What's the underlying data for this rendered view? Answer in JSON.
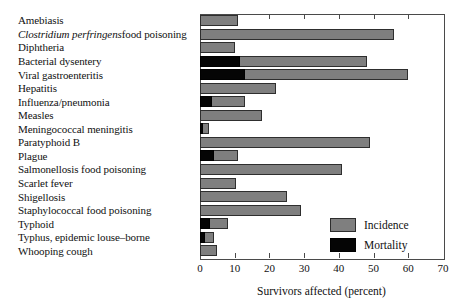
{
  "chart_data": {
    "type": "bar",
    "orientation": "horizontal",
    "title": "",
    "xlabel": "Survivors affected (percent)",
    "ylabel": "",
    "xlim": [
      0,
      70
    ],
    "xticks": [
      0,
      10,
      20,
      30,
      40,
      50,
      60,
      70
    ],
    "grid": false,
    "legend_position": "inside-lower-right",
    "categories": [
      "Amebiasis",
      "Clostridium perfringens food poisoning",
      "Diphtheria",
      "Bacterial dysentery",
      "Viral gastroenteritis",
      "Hepatitis",
      "Influenza/pneumonia",
      "Measles",
      "Meningococcal meningitis",
      "Paratyphoid B",
      "Plague",
      "Salmonellosis food poisoning",
      "Scarlet fever",
      "Shigellosis",
      "Staphylococcal food poisoning",
      "Typhoid",
      "Typhus, epidemic louse-borne",
      "Whooping cough"
    ],
    "category_label_parts": [
      {
        "italic": "",
        "plain": "Amebiasis"
      },
      {
        "italic": "Clostridium perfringens",
        "plain": " food poisoning"
      },
      {
        "italic": "",
        "plain": "Diphtheria"
      },
      {
        "italic": "",
        "plain": "Bacterial dysentery"
      },
      {
        "italic": "",
        "plain": "Viral gastroenteritis"
      },
      {
        "italic": "",
        "plain": "Hepatitis"
      },
      {
        "italic": "",
        "plain": "Influenza/pneumonia"
      },
      {
        "italic": "",
        "plain": "Measles"
      },
      {
        "italic": "",
        "plain": "Meningococcal meningitis"
      },
      {
        "italic": "",
        "plain": "Paratyphoid B"
      },
      {
        "italic": "",
        "plain": "Plague"
      },
      {
        "italic": "",
        "plain": "Salmonellosis food poisoning"
      },
      {
        "italic": "",
        "plain": "Scarlet fever"
      },
      {
        "italic": "",
        "plain": "Shigellosis"
      },
      {
        "italic": "",
        "plain": "Staphylococcal food poisoning"
      },
      {
        "italic": "",
        "plain": "Typhoid"
      },
      {
        "italic": "",
        "plain": "Typhus, epidemic louse–borne"
      },
      {
        "italic": "",
        "plain": "Whooping cough"
      }
    ],
    "series": [
      {
        "name": "Incidence",
        "color": "#7f7f7f",
        "values": [
          11,
          56,
          10,
          48,
          60,
          22,
          13,
          18,
          2.5,
          49,
          11,
          41,
          10.5,
          25,
          29,
          8,
          4,
          5
        ]
      },
      {
        "name": "Mortality",
        "color": "#050505",
        "values": [
          0,
          0,
          0,
          11.5,
          13,
          0,
          3.5,
          0,
          1,
          0,
          4,
          0,
          0,
          0,
          0,
          3,
          1.5,
          0
        ]
      }
    ]
  },
  "legend": {
    "items": [
      {
        "label": "Incidence",
        "swatch": "incidence-swatch"
      },
      {
        "label": "Mortality",
        "swatch": "mortality-swatch"
      }
    ]
  },
  "axis": {
    "x_title": "Survivors affected (percent)",
    "tick_labels": [
      "0",
      "10",
      "20",
      "30",
      "40",
      "50",
      "60",
      "70"
    ]
  }
}
